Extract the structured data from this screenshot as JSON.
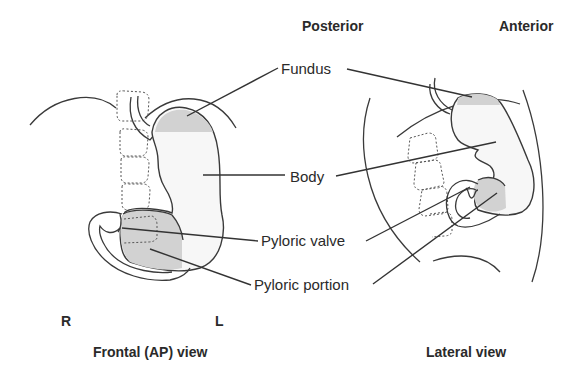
{
  "orientation_labels": {
    "posterior": "Posterior",
    "anterior": "Anterior",
    "right": "R",
    "left": "L"
  },
  "view_titles": {
    "frontal": "Frontal (AP) view",
    "lateral": "Lateral view"
  },
  "structure_labels": {
    "fundus": "Fundus",
    "body": "Body",
    "pyloric_valve": "Pyloric valve",
    "pyloric_portion": "Pyloric portion"
  },
  "colors": {
    "line": "#3a3a3a",
    "shading": "#d2d2d2",
    "stomach_fill": "#f7f7f7",
    "background": "#ffffff"
  }
}
